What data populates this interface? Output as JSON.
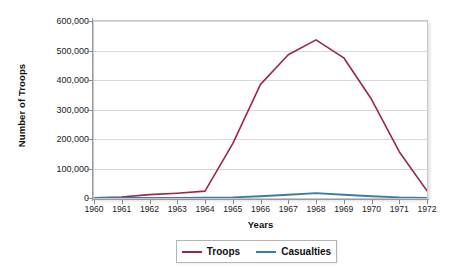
{
  "chart_data": {
    "type": "line",
    "title": "",
    "xlabel": "Years",
    "ylabel": "Number of Troops",
    "x": [
      1960,
      1961,
      1962,
      1963,
      1964,
      1965,
      1966,
      1967,
      1968,
      1969,
      1970,
      1971,
      1972
    ],
    "xticklabels": [
      "1960",
      "1961",
      "1962",
      "1963",
      "1964",
      "1965",
      "1966",
      "1967",
      "1968",
      "1969",
      "1970",
      "1971",
      "1972"
    ],
    "yticklabels": [
      "0",
      "100,000",
      "200,000",
      "300,000",
      "400,000",
      "500,000",
      "600,000"
    ],
    "yticks": [
      0,
      100000,
      200000,
      300000,
      400000,
      500000,
      600000
    ],
    "ylim": [
      0,
      600000
    ],
    "xlim": [
      1960,
      1972
    ],
    "grid": "horizontal",
    "legend_position": "below-axes",
    "series": [
      {
        "name": "Troops",
        "color": "#9B2743",
        "values": [
          900,
          3200,
          11300,
          16300,
          23300,
          184300,
          385300,
          485600,
          536100,
          475200,
          334600,
          156800,
          24200
        ]
      },
      {
        "name": "Casualties",
        "color": "#3A7CA5",
        "values": [
          0,
          0,
          0,
          0,
          1000,
          2000,
          6000,
          11000,
          16500,
          11000,
          6000,
          2000,
          600
        ]
      }
    ]
  },
  "legend": {
    "items": [
      {
        "label": "Troops",
        "color": "#9B2743"
      },
      {
        "label": "Casualties",
        "color": "#3A7CA5"
      }
    ]
  }
}
